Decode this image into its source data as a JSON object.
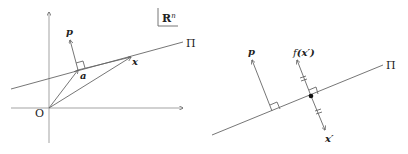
{
  "left_panel": {
    "space_label": "R",
    "space_superscript": "n",
    "origin_label": "O",
    "plane_label": "Π",
    "point_a_label": "a",
    "point_x_label": "x",
    "normal_label": "p"
  },
  "right_panel": {
    "plane_label": "Π",
    "normal_label": "p",
    "reflection_label_func": "f",
    "reflection_label_arg": "(x′)",
    "point_label": "x′"
  },
  "colors": {
    "line": "#666666",
    "axis": "#999999",
    "text": "#222222"
  }
}
